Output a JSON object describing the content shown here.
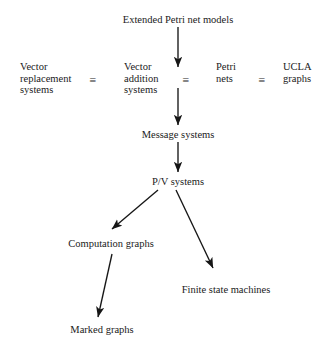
{
  "diagram": {
    "title": "Extended Petri net models",
    "equivalence_symbol": "≡",
    "nodes": [
      {
        "id": "extended-petri-net-models",
        "label": "Extended Petri net models",
        "x": 178,
        "y": 14,
        "align": "center"
      },
      {
        "id": "vector-replacement-systems",
        "label": "Vector\nreplacement\nsystems",
        "x": 20,
        "y": 61,
        "align": "left"
      },
      {
        "id": "vector-addition-systems",
        "label": "Vector\naddition\nsystems",
        "x": 124,
        "y": 61,
        "align": "left"
      },
      {
        "id": "petri-nets",
        "label": "Petri\nnets",
        "x": 216,
        "y": 61,
        "align": "left"
      },
      {
        "id": "ucla-graphs",
        "label": "UCLA\ngraphs",
        "x": 283,
        "y": 61,
        "align": "left"
      },
      {
        "id": "message-systems",
        "label": "Message systems",
        "x": 178,
        "y": 129,
        "align": "center"
      },
      {
        "id": "pv-systems",
        "label": "P/V systems",
        "x": 178,
        "y": 176,
        "align": "center"
      },
      {
        "id": "computation-graphs",
        "label": "Computation graphs",
        "x": 111,
        "y": 238,
        "align": "center"
      },
      {
        "id": "finite-state-machines",
        "label": "Finite state machines",
        "x": 226,
        "y": 284,
        "align": "center"
      },
      {
        "id": "marked-graphs",
        "label": "Marked graphs",
        "x": 102,
        "y": 324,
        "align": "center"
      }
    ],
    "equivalences": [
      {
        "id": "equiv-1",
        "between": [
          "vector-replacement-systems",
          "vector-addition-systems"
        ],
        "x": 93,
        "y": 74
      },
      {
        "id": "equiv-2",
        "between": [
          "vector-addition-systems",
          "petri-nets"
        ],
        "x": 186,
        "y": 74
      },
      {
        "id": "equiv-3",
        "between": [
          "petri-nets",
          "ucla-graphs"
        ],
        "x": 262,
        "y": 74
      }
    ],
    "arrows": [
      {
        "id": "arrow-models-to-vector-addition",
        "from": "extended-petri-net-models",
        "to": "vector-addition-systems",
        "x1": 178,
        "y1": 27,
        "x2": 178,
        "y2": 67
      },
      {
        "id": "arrow-vector-addition-to-message",
        "from": "vector-addition-systems",
        "to": "message-systems",
        "x1": 178,
        "y1": 88,
        "x2": 178,
        "y2": 125
      },
      {
        "id": "arrow-message-to-pv",
        "from": "message-systems",
        "to": "pv-systems",
        "x1": 178,
        "y1": 142,
        "x2": 178,
        "y2": 172
      },
      {
        "id": "arrow-pv-to-computation-graphs",
        "from": "pv-systems",
        "to": "computation-graphs",
        "x1": 158,
        "y1": 190,
        "x2": 112,
        "y2": 229
      },
      {
        "id": "arrow-pv-to-finite-state-machines",
        "from": "pv-systems",
        "to": "finite-state-machines",
        "x1": 176,
        "y1": 190,
        "x2": 213,
        "y2": 268
      },
      {
        "id": "arrow-computation-graphs-to-marked-graphs",
        "from": "computation-graphs",
        "to": "marked-graphs",
        "x1": 112,
        "y1": 254,
        "x2": 98,
        "y2": 317
      }
    ],
    "colors": {
      "background": "#ffffff",
      "text": "#1a1a1a",
      "stroke": "#161616"
    }
  }
}
